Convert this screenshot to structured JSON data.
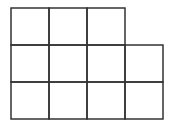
{
  "diagram": {
    "rows": [
      3,
      4,
      4
    ],
    "cell_size": 38,
    "origin": [
      11,
      8
    ],
    "line_color": "#333333",
    "line_width": 1.5
  }
}
